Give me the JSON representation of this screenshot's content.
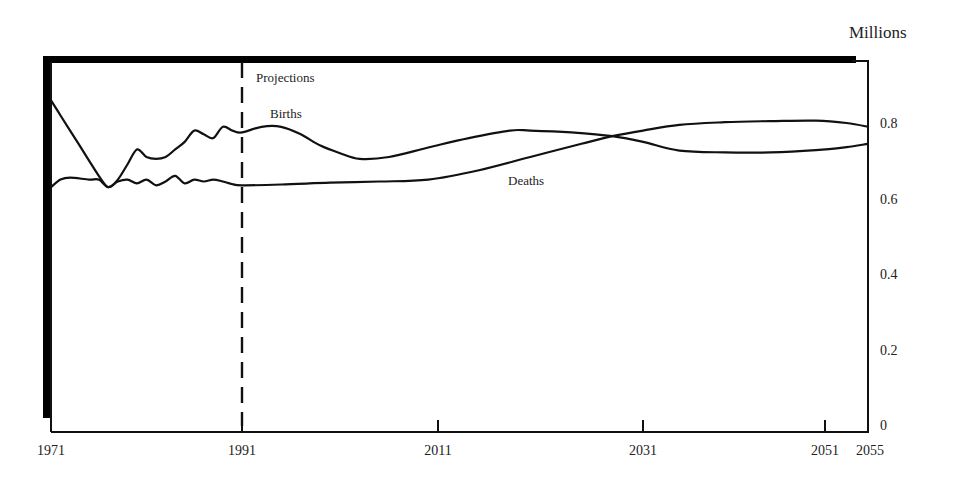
{
  "chart_data": {
    "type": "line",
    "title": "",
    "xlabel": "",
    "ylabel": "Millions",
    "x_ticks": [
      1971,
      1991,
      2011,
      2031,
      2051,
      2055
    ],
    "y_ticks": [
      0,
      0.2,
      0.4,
      0.6,
      0.8
    ],
    "xlim": [
      1971,
      2055
    ],
    "ylim": [
      0,
      0.9
    ],
    "grid": false,
    "y_axis_position": "right",
    "annotations": [
      {
        "text": "Projections",
        "x": 1991,
        "note": "dashed vertical line marks start of projections"
      },
      {
        "text": "Births",
        "x": 1994
      },
      {
        "text": "Deaths",
        "x": 2020
      }
    ],
    "series": [
      {
        "name": "Births",
        "x": [
          1971,
          1972,
          1973,
          1974,
          1975,
          1976,
          1977,
          1978,
          1979,
          1980,
          1981,
          1982,
          1983,
          1984,
          1985,
          1986,
          1987,
          1988,
          1989,
          1990,
          1991,
          1993,
          1995,
          1997,
          1999,
          2001,
          2003,
          2006,
          2010,
          2014,
          2018,
          2020,
          2024,
          2028,
          2031,
          2035,
          2040,
          2045,
          2050,
          2053,
          2055
        ],
        "values": [
          0.86,
          0.82,
          0.78,
          0.74,
          0.7,
          0.66,
          0.63,
          0.65,
          0.69,
          0.73,
          0.71,
          0.705,
          0.71,
          0.73,
          0.75,
          0.78,
          0.77,
          0.76,
          0.79,
          0.78,
          0.775,
          0.79,
          0.79,
          0.77,
          0.74,
          0.72,
          0.705,
          0.71,
          0.735,
          0.76,
          0.78,
          0.78,
          0.775,
          0.765,
          0.75,
          0.727,
          0.722,
          0.722,
          0.728,
          0.736,
          0.745
        ]
      },
      {
        "name": "Deaths",
        "x": [
          1971,
          1972,
          1973,
          1975,
          1976,
          1977,
          1978,
          1979,
          1980,
          1981,
          1982,
          1983,
          1984,
          1985,
          1986,
          1987,
          1988,
          1989,
          1990,
          1991,
          1995,
          2000,
          2005,
          2010,
          2015,
          2020,
          2025,
          2028,
          2031,
          2035,
          2040,
          2045,
          2050,
          2053,
          2055
        ],
        "values": [
          0.63,
          0.65,
          0.655,
          0.65,
          0.65,
          0.63,
          0.645,
          0.65,
          0.64,
          0.65,
          0.635,
          0.645,
          0.66,
          0.64,
          0.65,
          0.645,
          0.65,
          0.645,
          0.638,
          0.635,
          0.637,
          0.642,
          0.645,
          0.65,
          0.675,
          0.71,
          0.745,
          0.765,
          0.78,
          0.795,
          0.802,
          0.805,
          0.806,
          0.8,
          0.79
        ]
      }
    ]
  },
  "labels": {
    "unit": "Millions",
    "projections": "Projections",
    "births": "Births",
    "deaths": "Deaths"
  },
  "colors": {
    "line": "#111111",
    "frame": "#000000",
    "background": "#ffffff"
  }
}
